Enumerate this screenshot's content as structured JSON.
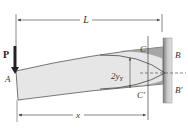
{
  "figure": {
    "labels": {
      "L": "L",
      "P": "P",
      "A": "A",
      "B": "B",
      "B_prime": "B′",
      "C": "C",
      "C_prime": "C′",
      "two_yY": "2y",
      "two_yY_sub": "Y",
      "x": "x"
    },
    "colors": {
      "beam_fill": "#e6e6e6",
      "beam_stroke": "#555555",
      "wall_dark": "#8a8a8a",
      "wall_light": "#d4d4d4",
      "plastic_zone": "#9a9a9a",
      "line": "#444444"
    }
  }
}
